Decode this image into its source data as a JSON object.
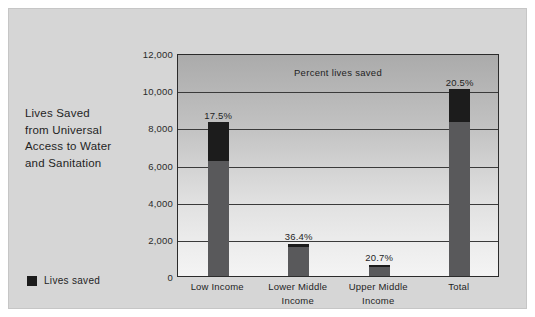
{
  "figure": {
    "title_lines": [
      "Lives Saved",
      "from Universal",
      "Access to Water",
      "and Sanitation"
    ],
    "legend": {
      "label": "Lives saved",
      "color": "#1c1c1c"
    },
    "colors": {
      "panel_background": "#d6d6d6",
      "plot_border": "#2b2b2b",
      "bar_dark": "#1c1c1c",
      "bar_gray": "#59595b",
      "gridline": "#3a3a3a",
      "text": "#1f1f1f"
    }
  },
  "chart_data": {
    "type": "bar",
    "title": "Lives Saved from Universal Access to Water and Sanitation",
    "annotation": "Percent lives saved",
    "xlabel": "",
    "ylabel": "",
    "ylim": [
      0,
      12000
    ],
    "grid": true,
    "legend_position": "bottom-left-outside",
    "yticks": [
      0,
      2000,
      4000,
      6000,
      8000,
      10000,
      12000
    ],
    "ytick_labels": [
      "0",
      "2,000",
      "4,000",
      "6,000",
      "8,000",
      "10,000",
      "12,000"
    ],
    "categories": [
      "Low Income",
      "Lower Middle Income",
      "Upper Middle Income",
      "Total"
    ],
    "category_lines": [
      [
        "Low Income"
      ],
      [
        "Lower Middle",
        "Income"
      ],
      [
        "Upper Middle",
        "Income"
      ],
      [
        "Total"
      ]
    ],
    "series": [
      {
        "name": "Base",
        "color": "#59595b",
        "values": [
          6200,
          1550,
          470,
          8300
        ]
      },
      {
        "name": "Lives saved",
        "color": "#1c1c1c",
        "values": [
          2100,
          200,
          150,
          1750
        ]
      }
    ],
    "totals": [
      8300,
      1750,
      620,
      10050
    ],
    "point_labels": [
      "17.5%",
      "36.4%",
      "20.7%",
      "20.5%"
    ],
    "percent_values": [
      17.5,
      36.4,
      20.7,
      20.5
    ]
  }
}
